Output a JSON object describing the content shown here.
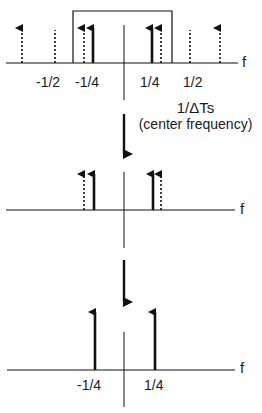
{
  "panel1": {
    "axis_label": "f",
    "ticks": [
      "-1/2",
      "-1/4",
      "1/4",
      "1/2"
    ],
    "annotation_line1": "1/ΔTs",
    "annotation_line2": "(center frequency)",
    "solid_arrows_at": [
      "-1/4",
      "1/4"
    ],
    "dotted_arrows_at": [
      "-3/4",
      "-1/4",
      "1/4",
      "3/4"
    ],
    "dotted_markers_at": [
      "-1/2",
      "1/2"
    ],
    "filter_box": "passband between -1/2 and 1/2"
  },
  "panel2": {
    "axis_label": "f"
  },
  "panel3": {
    "axis_label": "f",
    "ticks": [
      "-1/4",
      "1/4"
    ]
  },
  "colors": {
    "line": "#111111",
    "background": "#ffffff"
  }
}
